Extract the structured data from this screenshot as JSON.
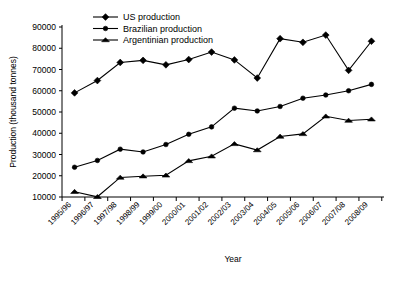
{
  "chart_data": {
    "type": "line",
    "title": "",
    "xlabel": "Year",
    "ylabel": "Production (thousand tonnes)",
    "categories": [
      "1995/96",
      "1996/97",
      "1997/98",
      "1998/99",
      "1999/00",
      "2000/01",
      "2001/02",
      "2002/03",
      "2003/04",
      "2004/05",
      "2005/06",
      "2006/07",
      "2007/08",
      "2008/09"
    ],
    "ylim": [
      10000,
      90000
    ],
    "yticks": [
      10000,
      20000,
      30000,
      40000,
      50000,
      60000,
      70000,
      80000,
      90000
    ],
    "ytick_labels": [
      "10000",
      "20000",
      "30000",
      "40000",
      "50000",
      "60000",
      "70000",
      "80000",
      "90000"
    ],
    "grid": false,
    "legend_position": "top-left-inside",
    "series": [
      {
        "name": "US production",
        "marker": "diamond",
        "values": [
          59000,
          64800,
          73300,
          74300,
          72200,
          74700,
          78200,
          74500,
          66000,
          84500,
          82800,
          86200,
          69600,
          83300
        ]
      },
      {
        "name": "Brazilian production",
        "marker": "circle",
        "values": [
          24000,
          27200,
          32500,
          31200,
          34700,
          39500,
          43000,
          51800,
          50500,
          52600,
          56500,
          58000,
          60000,
          63000
        ]
      },
      {
        "name": "Argentinian production",
        "marker": "triangle",
        "values": [
          12500,
          10100,
          19200,
          19800,
          20200,
          27000,
          29200,
          35000,
          32100,
          38500,
          39700,
          48000,
          46000,
          46600
        ]
      }
    ]
  },
  "legend": {
    "items": [
      {
        "label": "US production",
        "marker": "diamond"
      },
      {
        "label": "Brazilian production",
        "marker": "circle"
      },
      {
        "label": "Argentinian production",
        "marker": "triangle"
      }
    ]
  }
}
